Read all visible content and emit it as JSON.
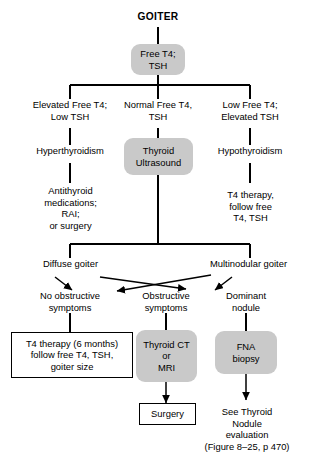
{
  "diagram": {
    "title": "GOITER",
    "root_test": {
      "line1": "Free T4;",
      "line2": "TSH"
    },
    "branches": {
      "left": {
        "line1": "Elevated Free T4;",
        "line2": "Low TSH"
      },
      "middle": {
        "line1": "Normal Free T4,",
        "line2": "TSH"
      },
      "right": {
        "line1": "Low Free T4;",
        "line2": "Elevated TSH"
      }
    },
    "diagnoses": {
      "left": "Hyperthyroidism",
      "right": "Hypothyroidism"
    },
    "ultrasound": {
      "line1": "Thyroid",
      "line2": "Ultrasound"
    },
    "left_treatment": {
      "line1": "Antithyroid",
      "line2": "medications;",
      "line3": "RAI;",
      "line4": "or surgery"
    },
    "right_treatment": {
      "line1": "T4 therapy,",
      "line2": "follow free",
      "line3": "T4, TSH"
    },
    "goiter_types": {
      "diffuse": "Diffuse goiter",
      "multinodular": "Multinodular goiter"
    },
    "symptoms": {
      "none": {
        "line1": "No obstructive",
        "line2": "symptoms"
      },
      "obstructive": {
        "line1": "Obstructive",
        "line2": "symptoms"
      },
      "dominant": {
        "line1": "Dominant",
        "line2": "nodule"
      }
    },
    "outcomes": {
      "t4_therapy": {
        "line1": "T4 therapy (6 months)",
        "line2": "follow free T4, TSH,",
        "line3": "goiter size"
      },
      "imaging": {
        "line1": "Thyroid CT",
        "line2": "or",
        "line3": "MRI"
      },
      "fna": {
        "line1": "FNA",
        "line2": "biopsy"
      },
      "surgery": "Surgery",
      "referral": {
        "line1": "See Thyroid",
        "line2": "Nodule",
        "line3": "evaluation",
        "line4": "(Figure 8–25, p 470)"
      }
    },
    "colors": {
      "process_fill": "#c9c9c9",
      "line": "#000000",
      "background": "#ffffff"
    }
  }
}
